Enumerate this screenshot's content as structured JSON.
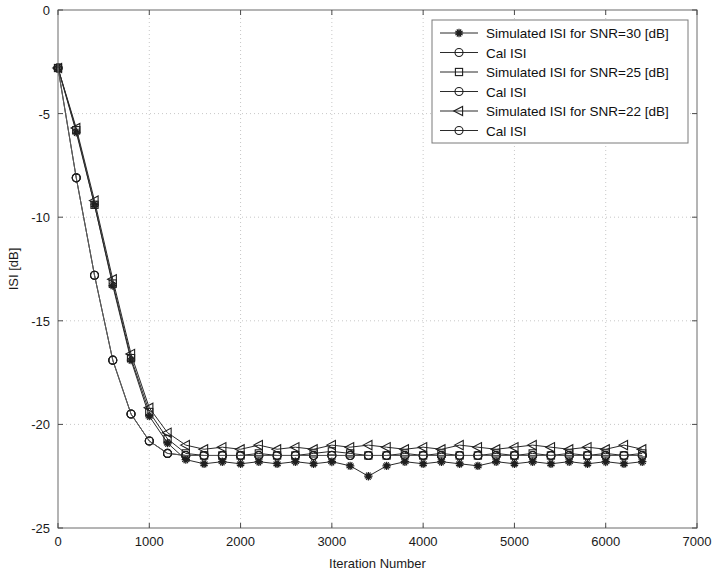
{
  "chart_data": {
    "type": "line",
    "title": "",
    "xlabel": "Iteration Number",
    "ylabel": "ISI [dB]",
    "xlim": [
      0,
      7000
    ],
    "ylim": [
      -25,
      0
    ],
    "xticks": [
      0,
      1000,
      2000,
      3000,
      4000,
      5000,
      6000,
      7000
    ],
    "yticks": [
      -25,
      -20,
      -15,
      -10,
      -5,
      0
    ],
    "xticklabels": [
      "0",
      "1000",
      "2000",
      "3000",
      "4000",
      "5000",
      "6000",
      "7000"
    ],
    "yticklabels": [
      "-25",
      "-20",
      "-15",
      "-10",
      "-5",
      "0"
    ],
    "grid": true,
    "legend_position": "upper right",
    "marker_interval": 200,
    "series": [
      {
        "name": "Simulated ISI for SNR=30 [dB]",
        "marker": "star",
        "x": [
          0,
          200,
          400,
          600,
          800,
          1000,
          1200,
          1400,
          1600,
          1800,
          2000,
          2200,
          2400,
          2600,
          2800,
          3000,
          3200,
          3400,
          3600,
          3800,
          4000,
          4200,
          4400,
          4600,
          4800,
          5000,
          5200,
          5400,
          5600,
          5800,
          6000,
          6200,
          6400
        ],
        "y": [
          -2.8,
          -5.9,
          -9.4,
          -13.3,
          -16.9,
          -19.6,
          -20.9,
          -21.7,
          -21.9,
          -21.8,
          -21.9,
          -21.8,
          -21.9,
          -21.8,
          -21.9,
          -21.8,
          -22.0,
          -22.5,
          -22.0,
          -21.8,
          -21.9,
          -21.8,
          -21.9,
          -22.0,
          -21.8,
          -21.9,
          -21.8,
          -21.9,
          -21.8,
          -21.9,
          -21.8,
          -21.9,
          -21.8
        ]
      },
      {
        "name": "Cal ISI",
        "marker": "circle",
        "x": [
          0,
          200,
          400,
          600,
          800,
          1000,
          1200,
          1400,
          1600,
          1800,
          2000,
          2200,
          2400,
          2600,
          2800,
          3000,
          3200,
          3400,
          3600,
          3800,
          4000,
          4200,
          4400,
          4600,
          4800,
          5000,
          5200,
          5400,
          5600,
          5800,
          6000,
          6200,
          6400
        ],
        "y": [
          -2.8,
          -8.1,
          -12.8,
          -16.9,
          -19.5,
          -20.8,
          -21.4,
          -21.5,
          -21.5,
          -21.5,
          -21.5,
          -21.5,
          -21.5,
          -21.5,
          -21.5,
          -21.5,
          -21.5,
          -21.5,
          -21.5,
          -21.5,
          -21.5,
          -21.5,
          -21.5,
          -21.5,
          -21.5,
          -21.5,
          -21.5,
          -21.5,
          -21.5,
          -21.5,
          -21.5,
          -21.5,
          -21.5
        ]
      },
      {
        "name": "Simulated ISI for SNR=25 [dB]",
        "marker": "square",
        "x": [
          0,
          200,
          400,
          600,
          800,
          1000,
          1200,
          1400,
          1600,
          1800,
          2000,
          2200,
          2400,
          2600,
          2800,
          3000,
          3200,
          3400,
          3600,
          3800,
          4000,
          4200,
          4400,
          4600,
          4800,
          5000,
          5200,
          5400,
          5600,
          5800,
          6000,
          6200,
          6400
        ],
        "y": [
          -2.8,
          -5.8,
          -9.4,
          -13.2,
          -16.8,
          -19.4,
          -20.7,
          -21.4,
          -21.5,
          -21.5,
          -21.5,
          -21.4,
          -21.5,
          -21.5,
          -21.4,
          -21.3,
          -21.4,
          -21.5,
          -21.5,
          -21.4,
          -21.5,
          -21.4,
          -21.5,
          -21.5,
          -21.4,
          -21.5,
          -21.4,
          -21.5,
          -21.4,
          -21.5,
          -21.4,
          -21.5,
          -21.4
        ]
      },
      {
        "name": "Cal ISI",
        "marker": "circle",
        "x": [
          0,
          200,
          400,
          600,
          800,
          1000,
          1200,
          1400,
          1600,
          1800,
          2000,
          2200,
          2400,
          2600,
          2800,
          3000,
          3200,
          3400,
          3600,
          3800,
          4000,
          4200,
          4400,
          4600,
          4800,
          5000,
          5200,
          5400,
          5600,
          5800,
          6000,
          6200,
          6400
        ],
        "y": [
          -2.8,
          -8.1,
          -12.8,
          -16.9,
          -19.5,
          -20.8,
          -21.4,
          -21.5,
          -21.5,
          -21.5,
          -21.5,
          -21.5,
          -21.5,
          -21.5,
          -21.5,
          -21.5,
          -21.5,
          -21.5,
          -21.5,
          -21.5,
          -21.5,
          -21.5,
          -21.5,
          -21.5,
          -21.5,
          -21.5,
          -21.5,
          -21.5,
          -21.5,
          -21.5,
          -21.5,
          -21.5,
          -21.5
        ]
      },
      {
        "name": "Simulated ISI for SNR=22 [dB]",
        "marker": "triangle-left",
        "x": [
          0,
          200,
          400,
          600,
          800,
          1000,
          1200,
          1400,
          1600,
          1800,
          2000,
          2200,
          2400,
          2600,
          2800,
          3000,
          3200,
          3400,
          3600,
          3800,
          4000,
          4200,
          4400,
          4600,
          4800,
          5000,
          5200,
          5400,
          5600,
          5800,
          6000,
          6200,
          6400
        ],
        "y": [
          -2.8,
          -5.7,
          -9.2,
          -13.0,
          -16.6,
          -19.2,
          -20.4,
          -21.0,
          -21.2,
          -21.1,
          -21.2,
          -21.0,
          -21.2,
          -21.1,
          -21.2,
          -21.0,
          -21.1,
          -21.0,
          -21.1,
          -21.2,
          -21.1,
          -21.2,
          -21.0,
          -21.1,
          -21.2,
          -21.1,
          -21.0,
          -21.1,
          -21.2,
          -21.1,
          -21.2,
          -21.0,
          -21.2
        ]
      },
      {
        "name": "Cal ISI",
        "marker": "circle",
        "x": [
          0,
          200,
          400,
          600,
          800,
          1000,
          1200,
          1400,
          1600,
          1800,
          2000,
          2200,
          2400,
          2600,
          2800,
          3000,
          3200,
          3400,
          3600,
          3800,
          4000,
          4200,
          4400,
          4600,
          4800,
          5000,
          5200,
          5400,
          5600,
          5800,
          6000,
          6200,
          6400
        ],
        "y": [
          -2.8,
          -8.1,
          -12.8,
          -16.9,
          -19.5,
          -20.8,
          -21.4,
          -21.5,
          -21.5,
          -21.5,
          -21.5,
          -21.5,
          -21.5,
          -21.5,
          -21.5,
          -21.5,
          -21.5,
          -21.5,
          -21.5,
          -21.5,
          -21.5,
          -21.5,
          -21.5,
          -21.5,
          -21.5,
          -21.5,
          -21.5,
          -21.5,
          -21.5,
          -21.5,
          -21.5,
          -21.5,
          -21.5
        ]
      }
    ]
  }
}
